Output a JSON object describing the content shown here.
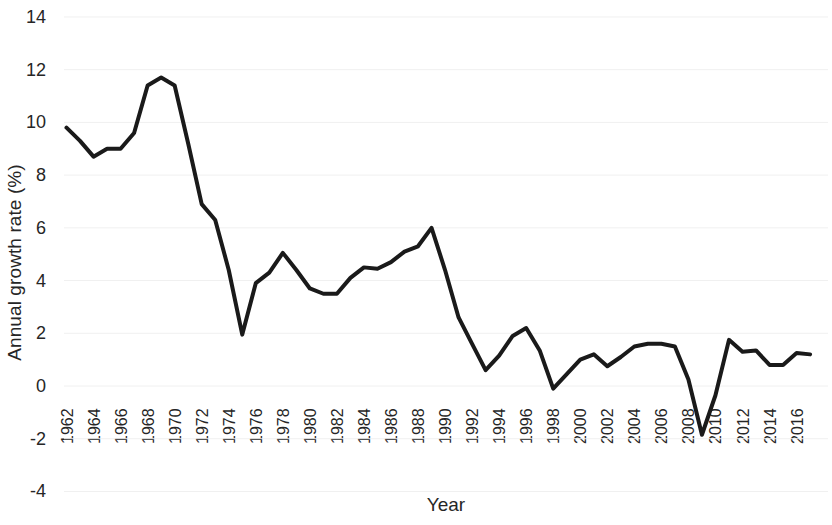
{
  "chart_data": {
    "type": "line",
    "title": "",
    "xlabel": "Year",
    "ylabel": "Annual growth rate (%)",
    "xlim": [
      1962,
      2017
    ],
    "ylim": [
      -4,
      14
    ],
    "y_ticks": [
      14,
      12,
      10,
      8,
      6,
      4,
      2,
      0,
      -2,
      -4
    ],
    "x_ticks": [
      1962,
      1964,
      1966,
      1968,
      1970,
      1972,
      1974,
      1976,
      1978,
      1980,
      1982,
      1984,
      1986,
      1988,
      1990,
      1992,
      1994,
      1996,
      1998,
      2000,
      2002,
      2004,
      2006,
      2008,
      2010,
      2012,
      2014,
      2016
    ],
    "grid": true,
    "grid_axis": "y",
    "legend": null,
    "line_color": "#1a1a1a",
    "line_width": 4,
    "x": [
      1962,
      1963,
      1964,
      1965,
      1966,
      1967,
      1968,
      1969,
      1970,
      1971,
      1972,
      1973,
      1974,
      1975,
      1976,
      1977,
      1978,
      1979,
      1980,
      1981,
      1982,
      1983,
      1984,
      1985,
      1986,
      1987,
      1988,
      1989,
      1990,
      1991,
      1992,
      1993,
      1994,
      1995,
      1996,
      1997,
      1998,
      1999,
      2000,
      2001,
      2002,
      2003,
      2004,
      2005,
      2006,
      2007,
      2008,
      2009,
      2010,
      2011,
      2012,
      2013,
      2014,
      2015,
      2016,
      2017
    ],
    "values": [
      9.8,
      9.3,
      8.7,
      9.0,
      9.0,
      9.6,
      11.4,
      11.7,
      11.4,
      9.2,
      6.9,
      6.3,
      4.4,
      1.95,
      3.9,
      4.3,
      5.05,
      4.4,
      3.7,
      3.5,
      3.5,
      4.1,
      4.5,
      4.45,
      4.7,
      5.1,
      5.3,
      6.0,
      4.4,
      2.6,
      1.6,
      0.6,
      1.15,
      1.9,
      2.2,
      1.35,
      -0.1,
      0.45,
      1.0,
      1.2,
      0.75,
      1.1,
      1.5,
      1.6,
      1.6,
      1.5,
      0.25,
      -1.85,
      -0.35,
      1.75,
      1.3,
      1.35,
      0.8,
      0.8,
      1.25,
      1.2
    ]
  }
}
